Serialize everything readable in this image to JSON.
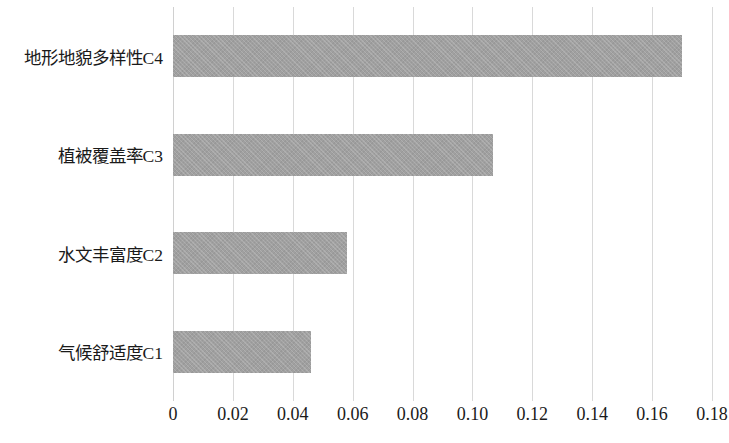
{
  "chart_data": {
    "type": "bar",
    "orientation": "horizontal",
    "title": "",
    "subtitle": "",
    "xlabel": "",
    "ylabel": "",
    "categories": [
      "气候舒适度C1",
      "水文丰富度C2",
      "植被覆盖率C3",
      "地形地貌多样性C4"
    ],
    "values": [
      0.046,
      0.058,
      0.107,
      0.17
    ],
    "series": [
      {
        "name": "权重",
        "values": [
          0.046,
          0.058,
          0.107,
          0.17
        ]
      }
    ],
    "xlim": [
      0,
      0.18
    ],
    "ylim": null,
    "xticks": [
      0,
      0.02,
      0.04,
      0.06,
      0.08,
      0.1,
      0.12,
      0.14,
      0.16,
      0.18
    ],
    "xtick_labels": [
      "0",
      "0.02",
      "0.04",
      "0.06",
      "0.08",
      "0.10",
      "0.12",
      "0.14",
      "0.16",
      "0.18"
    ],
    "grid": "vertical",
    "legend": null,
    "legend_position": "none",
    "bar_color": "#a0a0a0",
    "gridline_color": "#d9d9d9",
    "background_color": "#ffffff",
    "text_color": "#1a1a1a",
    "annotations": []
  }
}
